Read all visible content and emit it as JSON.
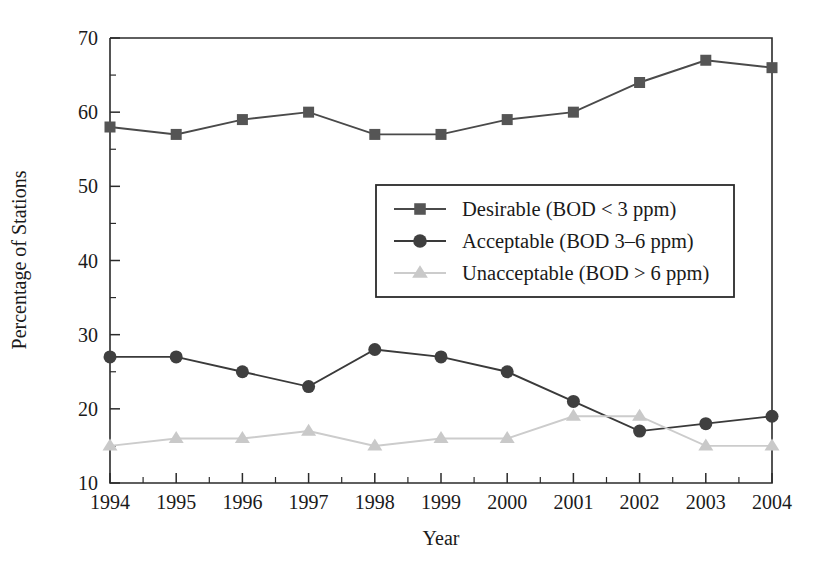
{
  "chart_data": {
    "type": "line",
    "title": "",
    "xlabel": "Year",
    "ylabel": "Percentage of Stations",
    "categories": [
      "1994",
      "1995",
      "1996",
      "1997",
      "1998",
      "1999",
      "2000",
      "2001",
      "2002",
      "2003",
      "2004"
    ],
    "x": [
      1994,
      1995,
      1996,
      1997,
      1998,
      1999,
      2000,
      2001,
      2002,
      2003,
      2004
    ],
    "xlim": [
      1994,
      2004
    ],
    "ylim": [
      10,
      70
    ],
    "y_major_ticks": [
      10,
      20,
      30,
      40,
      50,
      60,
      70
    ],
    "y_minor_ticks": [
      15,
      25,
      35,
      45,
      55,
      65
    ],
    "x_minor_ticks": [
      1994.5,
      1995.5,
      1996.5,
      1997.5,
      1998.5,
      1999.5,
      2000.5,
      2001.5,
      2002.5,
      2003.5
    ],
    "grid": false,
    "legend_position": "center",
    "series": [
      {
        "name": "Desirable (BOD < 3 ppm)",
        "marker": "square",
        "color": "#555555",
        "line_color": "#4a4a4a",
        "values": [
          58,
          57,
          59,
          60,
          57,
          57,
          59,
          60,
          64,
          67,
          66
        ]
      },
      {
        "name": "Acceptable (BOD 3–6 ppm)",
        "marker": "circle",
        "color": "#3f3f3f",
        "line_color": "#3a3a3a",
        "values": [
          27,
          27,
          25,
          23,
          28,
          27,
          25,
          21,
          17,
          18,
          19
        ]
      },
      {
        "name": "Unacceptable (BOD > 6 ppm)",
        "marker": "triangle",
        "color": "#c9c9c9",
        "line_color": "#cccccc",
        "values": [
          15,
          16,
          16,
          17,
          15,
          16,
          16,
          19,
          19,
          15,
          15
        ]
      }
    ]
  },
  "axes": {
    "y_title": "Percentage of Stations",
    "x_title": "Year"
  },
  "colors": {
    "axis": "#2b2b2b",
    "text": "#1a1a1a",
    "background": "#ffffff",
    "desirable": "#555555",
    "acceptable": "#3f3f3f",
    "unacceptable": "#c9c9c9"
  }
}
